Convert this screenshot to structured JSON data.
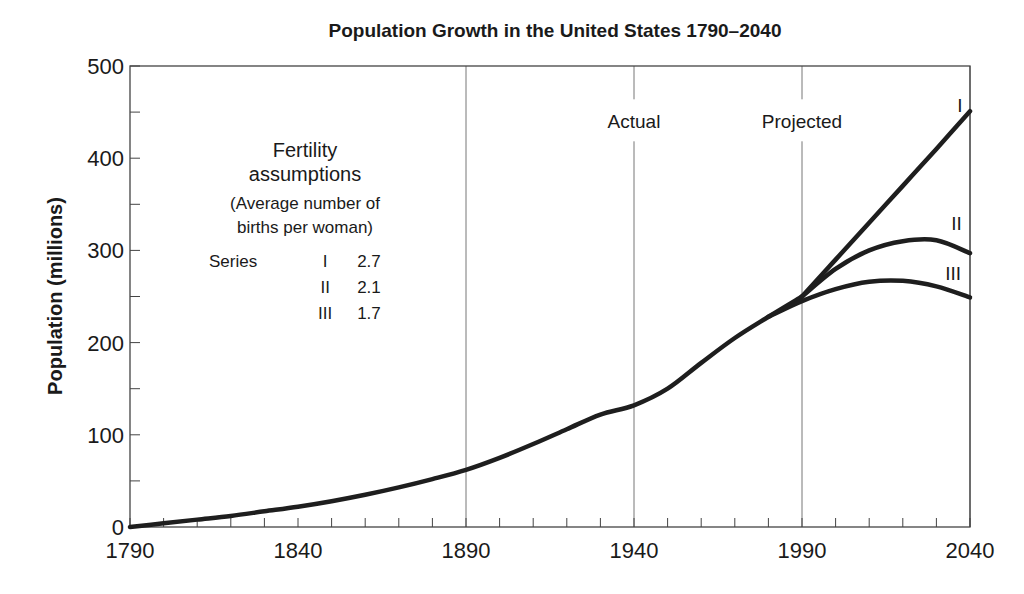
{
  "chart_data": {
    "type": "line",
    "title": "Population Growth in the United States 1790–2040",
    "xlabel": "",
    "ylabel": "Population (millions)",
    "xlim": [
      1790,
      2040
    ],
    "ylim": [
      0,
      500
    ],
    "x_ticks": [
      1790,
      1840,
      1890,
      1940,
      1990,
      2040
    ],
    "x_tick_labels": [
      "1790",
      "1840",
      "1890",
      "1940",
      "1990",
      "2040"
    ],
    "x_minor_tick_step": 10,
    "y_ticks": [
      0,
      100,
      200,
      300,
      400,
      500
    ],
    "y_tick_labels": [
      "0",
      "100",
      "200",
      "300",
      "400",
      "500"
    ],
    "y_minor_tick_step": 50,
    "vertical_gridlines_at": [
      1890,
      1940,
      1990,
      2040
    ],
    "grid": false,
    "annotations": [
      {
        "text": "Actual",
        "x": 1940,
        "y": 440
      },
      {
        "text": "Projected",
        "x": 1990,
        "y": 440
      },
      {
        "text": "I",
        "x": 2037,
        "y": 458
      },
      {
        "text": "II",
        "x": 2036,
        "y": 330
      },
      {
        "text": "III",
        "x": 2035,
        "y": 275
      }
    ],
    "series": [
      {
        "name": "Actual",
        "x": [
          1790,
          1800,
          1810,
          1820,
          1830,
          1840,
          1850,
          1860,
          1870,
          1880,
          1890,
          1900,
          1910,
          1920,
          1930,
          1940,
          1950,
          1960,
          1970,
          1980,
          1990
        ],
        "values": [
          0,
          4,
          8,
          12,
          17,
          22,
          28,
          35,
          43,
          52,
          62,
          75,
          90,
          106,
          122,
          132,
          150,
          178,
          205,
          228,
          250
        ]
      },
      {
        "name": "Series I",
        "fertility": 2.7,
        "x": [
          1990,
          2000,
          2010,
          2020,
          2030,
          2040
        ],
        "values": [
          250,
          290,
          330,
          370,
          410,
          451
        ]
      },
      {
        "name": "Series II",
        "fertility": 2.1,
        "x": [
          1990,
          2000,
          2010,
          2020,
          2030,
          2040
        ],
        "values": [
          250,
          280,
          300,
          310,
          311,
          297
        ]
      },
      {
        "name": "Series III",
        "fertility": 1.7,
        "x": [
          1980,
          1990,
          2000,
          2010,
          2020,
          2030,
          2040
        ],
        "values": [
          228,
          245,
          258,
          266,
          267,
          261,
          249
        ]
      }
    ],
    "legend": {
      "title": "Fertility assumptions",
      "subtitle": "(Average number of births per woman)",
      "entries": [
        {
          "label": "Series",
          "series": "I",
          "value": "2.7"
        },
        {
          "label": "",
          "series": "II",
          "value": "2.1"
        },
        {
          "label": "",
          "series": "III",
          "value": "1.7"
        }
      ],
      "position": "upper-left"
    }
  },
  "labels": {
    "title": "Population Growth in the United States 1790–2040",
    "ylabel": "Population (millions)",
    "actual": "Actual",
    "projected": "Projected",
    "series_I_tag": "I",
    "series_II_tag": "II",
    "series_III_tag": "III",
    "legend_title_1": "Fertility",
    "legend_title_2": "assumptions",
    "legend_sub_1": "(Average number of",
    "legend_sub_2": "births per woman)",
    "legend_rows": [
      {
        "label": "Series",
        "series": "I",
        "value": "2.7"
      },
      {
        "label": "",
        "series": "II",
        "value": "2.1"
      },
      {
        "label": "",
        "series": "III",
        "value": "1.7"
      }
    ]
  }
}
